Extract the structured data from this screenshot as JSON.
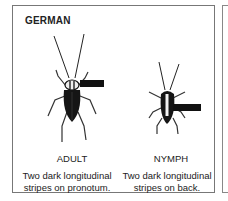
{
  "panel": {
    "title": "GERMAN",
    "specimens": [
      {
        "stage": "ADULT",
        "description_line1": "Two dark longitudinal",
        "description_line2": "stripes on pronotum.",
        "pointer": "pronotum-pointer"
      },
      {
        "stage": "NYMPH",
        "description_line1": "Two dark longitudinal",
        "description_line2": "stripes on back.",
        "pointer": "back-pointer"
      }
    ]
  },
  "colors": {
    "border": "#777777",
    "ink": "#111111",
    "background": "#ffffff"
  }
}
